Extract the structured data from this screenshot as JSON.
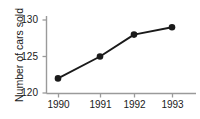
{
  "chart_data": {
    "type": "line",
    "title": "",
    "xlabel": "",
    "ylabel": "Number of cars sold",
    "categories": [
      "1990",
      "1991",
      "1992",
      "1993"
    ],
    "x": [
      1990,
      1991,
      1992,
      1993
    ],
    "values": [
      122,
      125,
      128,
      129
    ],
    "series": [
      {
        "name": "Number of cars sold",
        "values": [
          122,
          125,
          128,
          129
        ]
      }
    ],
    "ylim": [
      120,
      131.5
    ],
    "yticks": [
      120,
      125,
      130
    ],
    "ytick_labels": [
      "120",
      "125",
      "130"
    ],
    "xtick_labels": [
      "1990",
      "1991",
      "1992",
      "1993"
    ],
    "grid": false,
    "legend": false,
    "marker": "filled-circle",
    "line_color": "#1a1a1a",
    "marker_color": "#1a1a1a",
    "axis_color": "#9a9a9a",
    "background_color": "#ffffff"
  }
}
